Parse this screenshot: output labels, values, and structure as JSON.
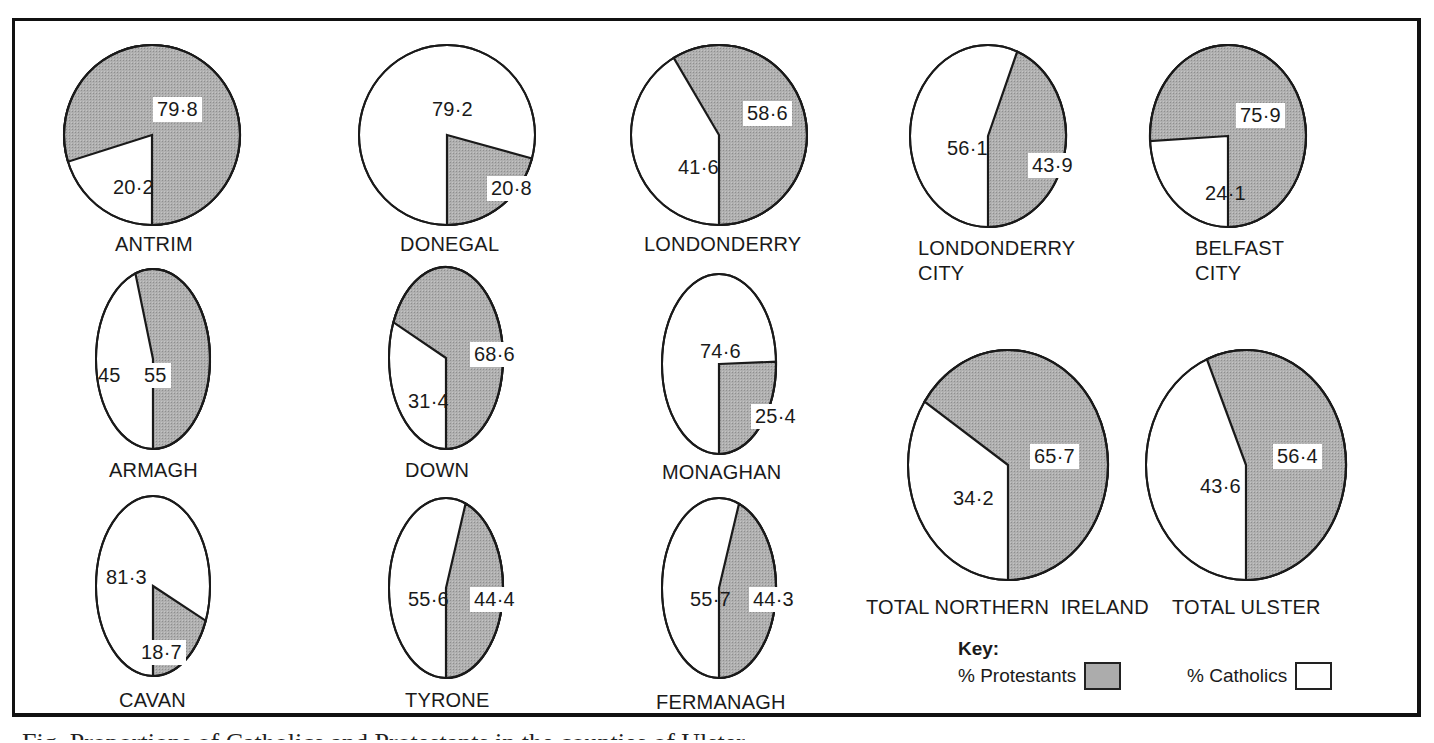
{
  "colors": {
    "protestant": "#a9a9a9",
    "catholic": "#ffffff",
    "outline": "#1a1a1a"
  },
  "chart_data": {
    "type": "pie",
    "title": "",
    "unit": "%",
    "series_names": [
      "% Protestants",
      "% Catholics"
    ],
    "pies": [
      {
        "name": "ANTRIM",
        "protestant": 79.8,
        "catholic": 20.2
      },
      {
        "name": "DONEGAL",
        "protestant": 20.8,
        "catholic": 79.2
      },
      {
        "name": "LONDONDERRY",
        "protestant": 58.6,
        "catholic": 41.6
      },
      {
        "name": "LONDONDERRY CITY",
        "protestant": 43.9,
        "catholic": 56.1
      },
      {
        "name": "BELFAST CITY",
        "protestant": 75.9,
        "catholic": 24.1
      },
      {
        "name": "ARMAGH",
        "protestant": 55,
        "catholic": 45
      },
      {
        "name": "DOWN",
        "protestant": 68.6,
        "catholic": 31.4
      },
      {
        "name": "MONAGHAN",
        "protestant": 25.4,
        "catholic": 74.6
      },
      {
        "name": "TOTAL NORTHERN IRELAND",
        "protestant": 65.7,
        "catholic": 34.2
      },
      {
        "name": "TOTAL ULSTER",
        "protestant": 56.4,
        "catholic": 43.6
      },
      {
        "name": "CAVAN",
        "protestant": 18.7,
        "catholic": 81.3
      },
      {
        "name": "TYRONE",
        "protestant": 44.4,
        "catholic": 55.6
      },
      {
        "name": "FERMANAGH",
        "protestant": 44.3,
        "catholic": 55.7
      }
    ],
    "legend_position": "bottom-right"
  },
  "pies": [
    {
      "name": "ANTRIM",
      "label": "ANTRIM",
      "p": 79.8,
      "c": 20.2,
      "p_txt": "79·8",
      "c_txt": "20·2",
      "cx": 152,
      "cy": 135,
      "rx": 88,
      "ry": 90,
      "lx": 115,
      "ly": 232,
      "pl": [
        153,
        97
      ],
      "cl": [
        113,
        175
      ]
    },
    {
      "name": "DONEGAL",
      "label": "DONEGAL",
      "p": 20.8,
      "c": 79.2,
      "p_txt": "20·8",
      "c_txt": "79·2",
      "cx": 447,
      "cy": 135,
      "rx": 88,
      "ry": 90,
      "lx": 400,
      "ly": 232,
      "pl": [
        487,
        176
      ],
      "cl": [
        432,
        97
      ]
    },
    {
      "name": "LONDONDERRY",
      "label": "LONDONDERRY",
      "p": 58.6,
      "c": 41.6,
      "p_txt": "58·6",
      "c_txt": "41·6",
      "cx": 719,
      "cy": 135,
      "rx": 88,
      "ry": 90,
      "lx": 644,
      "ly": 232,
      "pl": [
        743,
        101
      ],
      "cl": [
        678,
        155
      ]
    },
    {
      "name": "LONDONDERRY CITY",
      "label": "LONDONDERRY\nCITY",
      "p": 43.9,
      "c": 56.1,
      "p_txt": "43·9",
      "c_txt": "56·1",
      "cx": 988,
      "cy": 136,
      "rx": 78,
      "ry": 91,
      "lx": 918,
      "ly": 236,
      "pl": [
        1028,
        153
      ],
      "cl": [
        947,
        136
      ]
    },
    {
      "name": "BELFAST CITY",
      "label": "BELFAST\nCITY",
      "p": 75.9,
      "c": 24.1,
      "p_txt": "75·9",
      "c_txt": "24·1",
      "cx": 1228,
      "cy": 136,
      "rx": 78,
      "ry": 91,
      "lx": 1195,
      "ly": 236,
      "pl": [
        1236,
        103
      ],
      "cl": [
        1205,
        181
      ]
    },
    {
      "name": "ARMAGH",
      "label": "ARMAGH",
      "p": 55,
      "c": 45,
      "p_txt": "55",
      "c_txt": "45",
      "cx": 153,
      "cy": 359,
      "rx": 57,
      "ry": 90,
      "lx": 109,
      "ly": 458,
      "pl": [
        140,
        363
      ],
      "cl": [
        98,
        363
      ]
    },
    {
      "name": "DOWN",
      "label": "DOWN",
      "p": 68.6,
      "c": 31.4,
      "p_txt": "68·6",
      "c_txt": "31·4",
      "cx": 446,
      "cy": 358,
      "rx": 57,
      "ry": 91,
      "lx": 405,
      "ly": 458,
      "pl": [
        470,
        342
      ],
      "cl": [
        408,
        389
      ]
    },
    {
      "name": "MONAGHAN",
      "label": "MONAGHAN",
      "p": 25.4,
      "c": 74.6,
      "p_txt": "25·4",
      "c_txt": "74·6",
      "cx": 719,
      "cy": 364,
      "rx": 57,
      "ry": 90,
      "lx": 662,
      "ly": 460,
      "pl": [
        751,
        404
      ],
      "cl": [
        700,
        339
      ]
    },
    {
      "name": "TOTAL NORTHERN IRELAND",
      "label": "TOTAL NORTHERN  IRELAND",
      "p": 65.7,
      "c": 34.2,
      "p_txt": "65·7",
      "c_txt": "34·2",
      "cx": 1008,
      "cy": 465,
      "rx": 100,
      "ry": 115,
      "lx": 866,
      "ly": 595,
      "pl": [
        1030,
        444
      ],
      "cl": [
        953,
        486
      ]
    },
    {
      "name": "TOTAL ULSTER",
      "label": "TOTAL ULSTER",
      "p": 56.4,
      "c": 43.6,
      "p_txt": "56·4",
      "c_txt": "43·6",
      "cx": 1246,
      "cy": 465,
      "rx": 100,
      "ry": 115,
      "lx": 1172,
      "ly": 595,
      "pl": [
        1273,
        444
      ],
      "cl": [
        1200,
        474
      ]
    },
    {
      "name": "CAVAN",
      "label": "CAVAN",
      "p": 18.7,
      "c": 81.3,
      "p_txt": "18·7",
      "c_txt": "81·3",
      "cx": 153,
      "cy": 586,
      "rx": 57,
      "ry": 90,
      "lx": 119,
      "ly": 688,
      "pl": [
        137,
        640
      ],
      "cl": [
        106,
        565
      ]
    },
    {
      "name": "TYRONE",
      "label": "TYRONE",
      "p": 44.4,
      "c": 55.6,
      "p_txt": "44·4",
      "c_txt": "55·6",
      "cx": 446,
      "cy": 588,
      "rx": 57,
      "ry": 90,
      "lx": 405,
      "ly": 688,
      "pl": [
        470,
        587
      ],
      "cl": [
        408,
        587
      ]
    },
    {
      "name": "FERMANAGH",
      "label": "FERMANAGH",
      "p": 44.3,
      "c": 55.7,
      "p_txt": "44·3",
      "c_txt": "55·7",
      "cx": 719,
      "cy": 588,
      "rx": 57,
      "ry": 90,
      "lx": 656,
      "ly": 690,
      "pl": [
        749,
        587
      ],
      "cl": [
        690,
        587
      ]
    }
  ],
  "key": {
    "title": "Key:",
    "protestants": "% Protestants",
    "catholics": "% Catholics"
  },
  "caption": "Fig. Proportions of Catholics and Protestants in the counties of Ulster"
}
